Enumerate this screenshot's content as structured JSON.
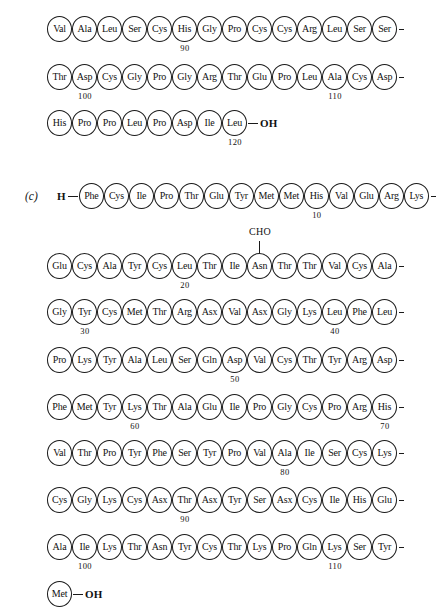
{
  "figure": {
    "panel_label": "(c)",
    "n_terminus": "H",
    "c_terminus": "OH",
    "modification_label": "CHO",
    "continuation_mark": "-"
  },
  "rows": [
    {
      "id": "row-a-1",
      "panel": "",
      "lead": "",
      "residues": [
        {
          "aa": "Val"
        },
        {
          "aa": "Ala"
        },
        {
          "aa": "Leu"
        },
        {
          "aa": "Ser"
        },
        {
          "aa": "Cys"
        },
        {
          "aa": "His",
          "num": "90"
        },
        {
          "aa": "Gly"
        },
        {
          "aa": "Pro"
        },
        {
          "aa": "Cys"
        },
        {
          "aa": "Cys"
        },
        {
          "aa": "Arg"
        },
        {
          "aa": "Leu"
        },
        {
          "aa": "Ser"
        },
        {
          "aa": "Ser"
        }
      ],
      "end": "continue"
    },
    {
      "id": "row-a-2",
      "panel": "",
      "lead": "",
      "residues": [
        {
          "aa": "Thr"
        },
        {
          "aa": "Asp",
          "num": "100"
        },
        {
          "aa": "Cys"
        },
        {
          "aa": "Gly"
        },
        {
          "aa": "Pro"
        },
        {
          "aa": "Gly"
        },
        {
          "aa": "Arg"
        },
        {
          "aa": "Thr"
        },
        {
          "aa": "Glu"
        },
        {
          "aa": "Pro"
        },
        {
          "aa": "Leu"
        },
        {
          "aa": "Ala",
          "num": "110"
        },
        {
          "aa": "Cys"
        },
        {
          "aa": "Asp"
        }
      ],
      "end": "continue"
    },
    {
      "id": "row-a-3",
      "panel": "",
      "lead": "",
      "residues": [
        {
          "aa": "His"
        },
        {
          "aa": "Pro"
        },
        {
          "aa": "Pro"
        },
        {
          "aa": "Leu"
        },
        {
          "aa": "Pro"
        },
        {
          "aa": "Asp"
        },
        {
          "aa": "Ile"
        },
        {
          "aa": "Leu",
          "num": "120"
        }
      ],
      "end": "OH"
    },
    {
      "id": "row-c-1",
      "panel": "(c)",
      "lead": "H",
      "residues": [
        {
          "aa": "Phe"
        },
        {
          "aa": "Cys"
        },
        {
          "aa": "Ile"
        },
        {
          "aa": "Pro"
        },
        {
          "aa": "Thr"
        },
        {
          "aa": "Glu"
        },
        {
          "aa": "Tyr"
        },
        {
          "aa": "Met"
        },
        {
          "aa": "Met"
        },
        {
          "aa": "His",
          "num": "10"
        },
        {
          "aa": "Val"
        },
        {
          "aa": "Glu"
        },
        {
          "aa": "Arg"
        },
        {
          "aa": "Lys"
        }
      ],
      "end": "continue"
    },
    {
      "id": "row-c-2",
      "panel": "",
      "lead": "",
      "residues": [
        {
          "aa": "Glu"
        },
        {
          "aa": "Cys"
        },
        {
          "aa": "Ala"
        },
        {
          "aa": "Tyr"
        },
        {
          "aa": "Cys"
        },
        {
          "aa": "Leu",
          "num": "20"
        },
        {
          "aa": "Thr"
        },
        {
          "aa": "Ile"
        },
        {
          "aa": "Asn",
          "cho": true
        },
        {
          "aa": "Thr"
        },
        {
          "aa": "Thr"
        },
        {
          "aa": "Val"
        },
        {
          "aa": "Cys"
        },
        {
          "aa": "Ala"
        }
      ],
      "end": "continue"
    },
    {
      "id": "row-c-3",
      "panel": "",
      "lead": "",
      "residues": [
        {
          "aa": "Gly"
        },
        {
          "aa": "Tyr",
          "num": "30"
        },
        {
          "aa": "Cys"
        },
        {
          "aa": "Met"
        },
        {
          "aa": "Thr"
        },
        {
          "aa": "Arg"
        },
        {
          "aa": "Asx"
        },
        {
          "aa": "Val"
        },
        {
          "aa": "Asx"
        },
        {
          "aa": "Gly"
        },
        {
          "aa": "Lys"
        },
        {
          "aa": "Leu",
          "num": "40"
        },
        {
          "aa": "Phe"
        },
        {
          "aa": "Leu"
        }
      ],
      "end": "continue"
    },
    {
      "id": "row-c-4",
      "panel": "",
      "lead": "",
      "residues": [
        {
          "aa": "Pro"
        },
        {
          "aa": "Lys"
        },
        {
          "aa": "Tyr"
        },
        {
          "aa": "Ala"
        },
        {
          "aa": "Leu"
        },
        {
          "aa": "Ser"
        },
        {
          "aa": "Gln"
        },
        {
          "aa": "Asp",
          "num": "50"
        },
        {
          "aa": "Val"
        },
        {
          "aa": "Cys"
        },
        {
          "aa": "Thr"
        },
        {
          "aa": "Tyr"
        },
        {
          "aa": "Arg"
        },
        {
          "aa": "Asp"
        }
      ],
      "end": "continue"
    },
    {
      "id": "row-c-5",
      "panel": "",
      "lead": "",
      "residues": [
        {
          "aa": "Phe"
        },
        {
          "aa": "Met"
        },
        {
          "aa": "Tyr"
        },
        {
          "aa": "Lys",
          "num": "60"
        },
        {
          "aa": "Thr"
        },
        {
          "aa": "Ala"
        },
        {
          "aa": "Glu"
        },
        {
          "aa": "Ile"
        },
        {
          "aa": "Pro"
        },
        {
          "aa": "Gly"
        },
        {
          "aa": "Cys"
        },
        {
          "aa": "Pro"
        },
        {
          "aa": "Arg"
        },
        {
          "aa": "His",
          "num": "70"
        }
      ],
      "end": "continue"
    },
    {
      "id": "row-c-6",
      "panel": "",
      "lead": "",
      "residues": [
        {
          "aa": "Val"
        },
        {
          "aa": "Thr"
        },
        {
          "aa": "Pro"
        },
        {
          "aa": "Tyr"
        },
        {
          "aa": "Phe"
        },
        {
          "aa": "Ser"
        },
        {
          "aa": "Tyr"
        },
        {
          "aa": "Pro"
        },
        {
          "aa": "Val"
        },
        {
          "aa": "Ala",
          "num": "80"
        },
        {
          "aa": "Ile"
        },
        {
          "aa": "Ser"
        },
        {
          "aa": "Cys"
        },
        {
          "aa": "Lys"
        }
      ],
      "end": "continue"
    },
    {
      "id": "row-c-7",
      "panel": "",
      "lead": "",
      "residues": [
        {
          "aa": "Cys"
        },
        {
          "aa": "Gly"
        },
        {
          "aa": "Lys"
        },
        {
          "aa": "Cys"
        },
        {
          "aa": "Asx"
        },
        {
          "aa": "Thr",
          "num": "90"
        },
        {
          "aa": "Asx"
        },
        {
          "aa": "Tyr"
        },
        {
          "aa": "Ser"
        },
        {
          "aa": "Asx"
        },
        {
          "aa": "Cys"
        },
        {
          "aa": "Ile"
        },
        {
          "aa": "His"
        },
        {
          "aa": "Glu"
        }
      ],
      "end": "continue"
    },
    {
      "id": "row-c-8",
      "panel": "",
      "lead": "",
      "residues": [
        {
          "aa": "Ala"
        },
        {
          "aa": "Ile",
          "num": "100"
        },
        {
          "aa": "Lys"
        },
        {
          "aa": "Thr"
        },
        {
          "aa": "Asn"
        },
        {
          "aa": "Tyr"
        },
        {
          "aa": "Cys"
        },
        {
          "aa": "Thr"
        },
        {
          "aa": "Lys"
        },
        {
          "aa": "Pro"
        },
        {
          "aa": "Gln"
        },
        {
          "aa": "Lys",
          "num": "110"
        },
        {
          "aa": "Ser"
        },
        {
          "aa": "Tyr"
        }
      ],
      "end": "continue"
    },
    {
      "id": "row-c-9",
      "panel": "",
      "lead": "",
      "residues": [
        {
          "aa": "Met"
        }
      ],
      "end": "OH"
    }
  ],
  "row_geometry": [
    {
      "top": 14,
      "left": 47
    },
    {
      "top": 62,
      "left": 47
    },
    {
      "top": 108,
      "left": 47
    },
    {
      "top": 181,
      "left": 25
    },
    {
      "top": 251,
      "left": 47
    },
    {
      "top": 297,
      "left": 47
    },
    {
      "top": 345,
      "left": 47
    },
    {
      "top": 392,
      "left": 47
    },
    {
      "top": 438,
      "left": 47
    },
    {
      "top": 485,
      "left": 47
    },
    {
      "top": 532,
      "left": 47
    },
    {
      "top": 579,
      "left": 47
    }
  ]
}
